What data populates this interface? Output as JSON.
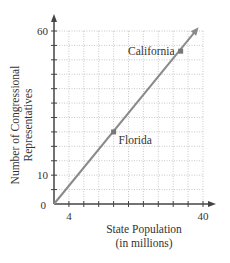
{
  "chart_data": {
    "type": "line",
    "title": "",
    "xlabel": "State Population (in millions)",
    "xlabel_lines": [
      "State Population",
      "(in millions)"
    ],
    "ylabel": "Number of Congressional Representatives",
    "ylabel_lines": [
      "Number of Congressional",
      "Representatives"
    ],
    "xlim": [
      0,
      40
    ],
    "ylim": [
      0,
      60
    ],
    "x_ticks": [
      0,
      4,
      8,
      12,
      16,
      20,
      24,
      28,
      32,
      36,
      40
    ],
    "x_tick_labels": {
      "4": "4",
      "40": "40"
    },
    "y_ticks": [
      0,
      5,
      10,
      15,
      20,
      25,
      30,
      35,
      40,
      45,
      50,
      55,
      60
    ],
    "y_tick_labels": {
      "10": "10",
      "60": "60"
    },
    "origin_label": "0",
    "grid": true,
    "line": {
      "x": [
        0,
        38.3
      ],
      "y": [
        0,
        60.5
      ],
      "arrow_end": true,
      "color": "#8a8a8a"
    },
    "points": [
      {
        "label": "Florida",
        "x": 16,
        "y": 25
      },
      {
        "label": "California",
        "x": 34,
        "y": 53
      }
    ],
    "legend": null
  }
}
